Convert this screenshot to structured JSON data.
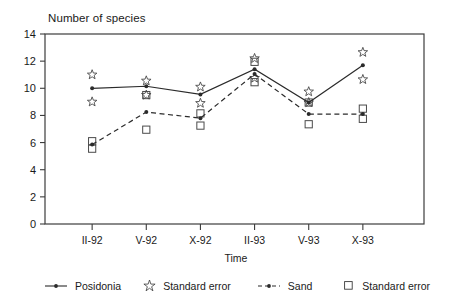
{
  "chart_data": {
    "type": "line",
    "title": "",
    "ylabel": "Number of species",
    "xlabel": "Time",
    "categories": [
      "II-92",
      "V-92",
      "X-92",
      "II-93",
      "V-93",
      "X-93"
    ],
    "ylim": [
      0,
      14
    ],
    "yticks": [
      0,
      2,
      4,
      6,
      8,
      10,
      12,
      14
    ],
    "grid": false,
    "legend_position": "bottom",
    "series": [
      {
        "name": "Posidonia",
        "marker": "dot",
        "line": "solid",
        "values": [
          10.0,
          10.15,
          9.55,
          11.4,
          8.95,
          11.7
        ],
        "error_marker": "star",
        "error_label": "Standard error",
        "error_upper": [
          11.0,
          10.55,
          10.1,
          12.2,
          9.75,
          12.65
        ],
        "error_lower": [
          9.0,
          9.5,
          8.9,
          10.75,
          8.95,
          10.65
        ]
      },
      {
        "name": "Sand",
        "marker": "dot",
        "line": "dashed",
        "values": [
          5.85,
          8.25,
          7.8,
          11.05,
          8.1,
          8.1
        ],
        "error_marker": "square",
        "error_label": "Standard error",
        "error_upper": [
          6.1,
          9.5,
          8.15,
          11.95,
          8.95,
          8.5
        ],
        "error_lower": [
          5.55,
          6.95,
          7.25,
          10.45,
          7.35,
          7.75
        ]
      }
    ]
  },
  "legend": {
    "items": [
      {
        "label": "Posidonia",
        "icon": "solid-line-dot-icon"
      },
      {
        "label": "Standard error",
        "icon": "star-outline-icon"
      },
      {
        "label": "Sand",
        "icon": "dashed-line-dot-icon"
      },
      {
        "label": "Standard error",
        "icon": "square-outline-icon"
      }
    ]
  },
  "colors": {
    "axis": "#3c3c3c",
    "series": "#2b2b2b",
    "background": "#ffffff"
  }
}
